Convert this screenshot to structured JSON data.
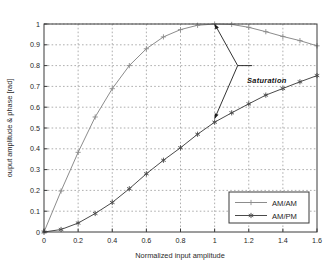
{
  "chart_data": {
    "type": "line",
    "title": "",
    "xlabel": "Normalized input amplitude",
    "ylabel": "ouput amplitude & phase [rad]",
    "xlim": [
      0,
      1.6
    ],
    "ylim": [
      0,
      1.0
    ],
    "grid": true,
    "grid_style": "dotted",
    "legend_position": "lower right",
    "xticks": [
      0,
      0.2,
      0.4,
      0.6,
      0.8,
      1,
      1.2,
      1.4,
      1.6
    ],
    "xtick_labels": [
      "0",
      "0.2",
      "0.4",
      "0.6",
      "0.8",
      "1",
      "1.2",
      "1.4",
      "1.6"
    ],
    "yticks": [
      0,
      0.1,
      0.2,
      0.3,
      0.4,
      0.5,
      0.6,
      0.7,
      0.8,
      0.9,
      1
    ],
    "ytick_labels": [
      "0",
      "0.1",
      "0.2",
      "0.3",
      "0.4",
      "0.5",
      "0.6",
      "0.7",
      "0.8",
      "0.9",
      "1"
    ],
    "x": [
      0,
      0.1,
      0.2,
      0.3,
      0.4,
      0.5,
      0.6,
      0.7,
      0.8,
      0.9,
      1.0,
      1.1,
      1.2,
      1.3,
      1.4,
      1.5,
      1.6
    ],
    "series": [
      {
        "name": "AM/AM",
        "marker": "plus",
        "color": "#8c8c8c",
        "values": [
          0,
          0.197,
          0.383,
          0.553,
          0.689,
          0.8,
          0.881,
          0.938,
          0.973,
          0.994,
          1.0,
          0.998,
          0.984,
          0.963,
          0.94,
          0.92,
          0.895
        ]
      },
      {
        "name": "AM/PM",
        "marker": "asterisk",
        "color": "#4a4a4a",
        "values": [
          0,
          0.012,
          0.043,
          0.089,
          0.142,
          0.208,
          0.28,
          0.345,
          0.405,
          0.47,
          0.528,
          0.573,
          0.616,
          0.658,
          0.69,
          0.722,
          0.752
        ]
      }
    ],
    "annotations": [
      {
        "text": "Saturation",
        "x": 1.22,
        "y": 0.8,
        "anchor_x": 1.135,
        "anchor_y": 0.8,
        "arrows": [
          {
            "to_x": 1.0,
            "to_y": 1.0
          },
          {
            "to_x": 1.0,
            "to_y": 0.545
          }
        ]
      }
    ]
  },
  "legend": {
    "entries": [
      {
        "label": "AM/AM"
      },
      {
        "label": "AM/PM"
      }
    ]
  }
}
